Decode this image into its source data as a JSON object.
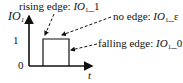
{
  "diagram": {
    "y_axis_label": "IO",
    "y_axis_sub": "1",
    "x_axis_label": "t",
    "y_ticks": [
      "1",
      "0"
    ],
    "annotations": {
      "rising": {
        "prefix": "rising edge: ",
        "var": "IO",
        "sub": "1",
        "suffix": "_1"
      },
      "none": {
        "prefix": "no edge: ",
        "var": "IO",
        "sub": "1",
        "suffix": "_ε"
      },
      "falling": {
        "prefix": "falling edge: ",
        "var": "IO",
        "sub": "1",
        "suffix": "_0"
      }
    },
    "colors": {
      "line": "#111111",
      "background": "#ffffff"
    }
  }
}
